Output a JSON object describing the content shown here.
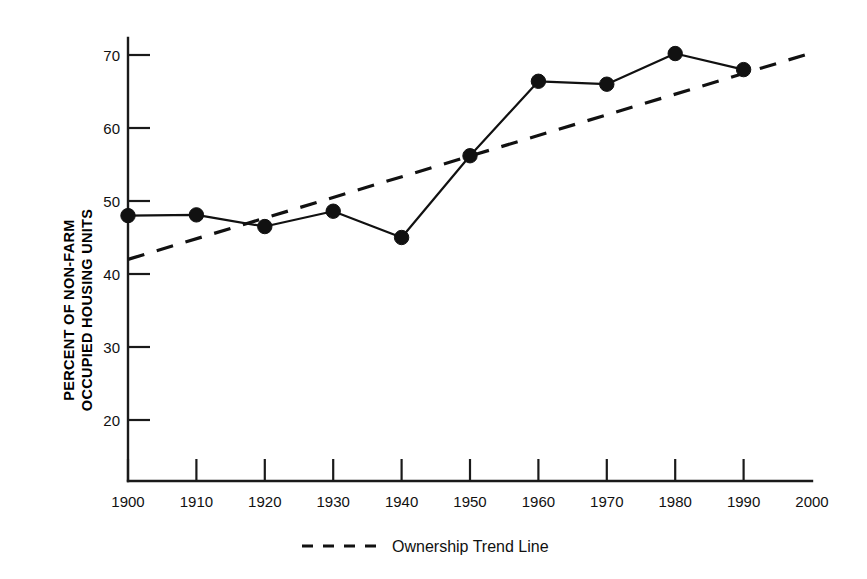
{
  "chart_data": {
    "type": "line",
    "title": "",
    "subtitle": "",
    "xlabel": "",
    "ylabel_line1": "PERCENT OF NON-FARM",
    "ylabel_line2": "OCCUPIED HOUSING UNITS",
    "x": [
      1900,
      1910,
      1920,
      1930,
      1940,
      1950,
      1960,
      1970,
      1980,
      1990
    ],
    "xtick_labels": [
      "1900",
      "1910",
      "1920",
      "1930",
      "1940",
      "1950",
      "1960",
      "1970",
      "1980",
      "1990",
      "2000"
    ],
    "xticks": [
      1900,
      1910,
      1920,
      1930,
      1940,
      1950,
      1960,
      1970,
      1980,
      1990,
      2000
    ],
    "ytick_labels": [
      "20",
      "30",
      "40",
      "50",
      "60",
      "70"
    ],
    "yticks": [
      20,
      30,
      40,
      50,
      60,
      70
    ],
    "xlim": [
      1900,
      2000
    ],
    "ylim": [
      13.5,
      73
    ],
    "grid": false,
    "legend_position": "bottom-center",
    "series": [
      {
        "name": "Homeownership rate",
        "style": "solid-with-markers",
        "values": [
          48.0,
          48.1,
          46.5,
          48.6,
          45.0,
          56.2,
          66.4,
          66.0,
          70.2,
          68.0
        ]
      },
      {
        "name": "Ownership Trend Line",
        "style": "dashed",
        "x": [
          1900,
          2000
        ],
        "values": [
          42.0,
          70.3
        ]
      }
    ],
    "legend": [
      {
        "label": "Ownership Trend Line",
        "marker": "dashed-line",
        "color": "#111111"
      }
    ],
    "colors": {
      "series_line": "#111111",
      "trend_line": "#111111",
      "axis": "#1a1a1a",
      "text": "#111111",
      "background": "#ffffff"
    }
  }
}
